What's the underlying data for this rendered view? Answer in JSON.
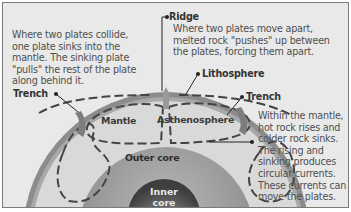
{
  "diagram": {
    "type": "cross-section",
    "annotations": {
      "collide": "Where two plates collide, one plate sinks into the mantle. The sinking plate \"pulls\" the rest of the plate along behind it.",
      "ridge_label": "Ridge",
      "ridge_text": "Where two plates move apart, melted rock \"pushes\" up between the plates, forcing them apart.",
      "lithosphere_label": "Lithosphere",
      "trench_left_label": "Trench",
      "trench_right_label": "Trench",
      "convection": "Within the mantle, hot rock rises and colder rock sinks. The rising and sinking produces circular currents. These currents can move the plates."
    },
    "layers": {
      "mantle": "Mantle",
      "asthenosphere": "Asthenosphere",
      "outer_core": "Outer core",
      "inner_core_line1": "Inner",
      "inner_core_line2": "core"
    },
    "colors": {
      "background": "#e9e9e9",
      "lithosphere": "#8a8a8a",
      "mantle": "#d6d6d6",
      "outer_core": "#9a9a9a",
      "inner_core": "#5a5a5a",
      "leader_line": "#222222"
    }
  }
}
